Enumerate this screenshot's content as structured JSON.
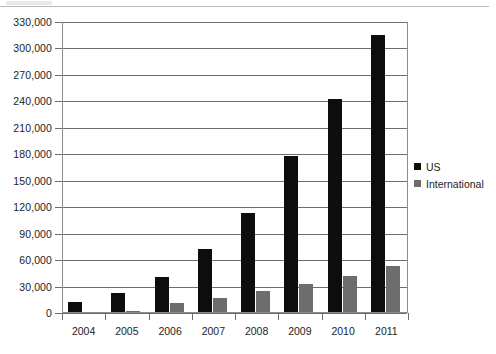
{
  "chart_data": {
    "type": "bar",
    "title": "",
    "subtitle": "",
    "xlabel": "",
    "ylabel": "",
    "categories": [
      "2004",
      "2005",
      "2006",
      "2007",
      "2008",
      "2009",
      "2010",
      "2011"
    ],
    "series": [
      {
        "name": "US",
        "color": "#0d0d0d",
        "values": [
          11000,
          21000,
          40000,
          72000,
          112000,
          177000,
          242000,
          314000
        ]
      },
      {
        "name": "International",
        "color": "#6d6d6d",
        "values": [
          0,
          1000,
          10000,
          16000,
          24000,
          32000,
          41000,
          52000
        ]
      }
    ],
    "ylim": [
      0,
      330000
    ],
    "ytick_step": 30000,
    "ytick_labels": [
      "0",
      "30,000",
      "60,000",
      "90,000",
      "120,000",
      "150,000",
      "180,000",
      "210,000",
      "240,000",
      "270,000",
      "300,000",
      "330,000"
    ],
    "ytick_values": [
      0,
      30000,
      60000,
      90000,
      120000,
      150000,
      180000,
      210000,
      240000,
      270000,
      300000,
      330000
    ],
    "grid": true,
    "grid_axis": "y",
    "legend_position": "right",
    "legend_entries": [
      "US",
      "International"
    ]
  },
  "colors": {
    "series_us": "#0d0d0d",
    "series_international": "#6d6d6d",
    "gridline": "#6e6e6e",
    "axis": "#8c8c8c",
    "text": "#1d1d1d",
    "background": "#ffffff"
  }
}
